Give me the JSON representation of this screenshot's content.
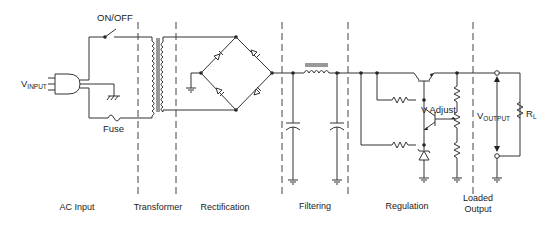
{
  "diagram": {
    "type": "power-supply-block-schematic",
    "labels": {
      "switch": "ON/OFF",
      "fuse": "Fuse",
      "vinput_main": "V",
      "vinput_sub": "INPUT",
      "vadjust": "V Adjust",
      "voutput_main": "V",
      "voutput_sub": "OUTPUT",
      "rl_main": "R",
      "rl_sub": "L"
    },
    "sections": [
      {
        "id": "ac-input",
        "label": "AC Input"
      },
      {
        "id": "transformer",
        "label": "Transformer"
      },
      {
        "id": "rectification",
        "label": "Rectification"
      },
      {
        "id": "filtering",
        "label": "Filtering"
      },
      {
        "id": "regulation",
        "label": "Regulation"
      },
      {
        "id": "loaded-output",
        "label_line1": "Loaded",
        "label_line2": "Output"
      }
    ],
    "colors": {
      "line": "#333333",
      "background": "#ffffff"
    }
  }
}
